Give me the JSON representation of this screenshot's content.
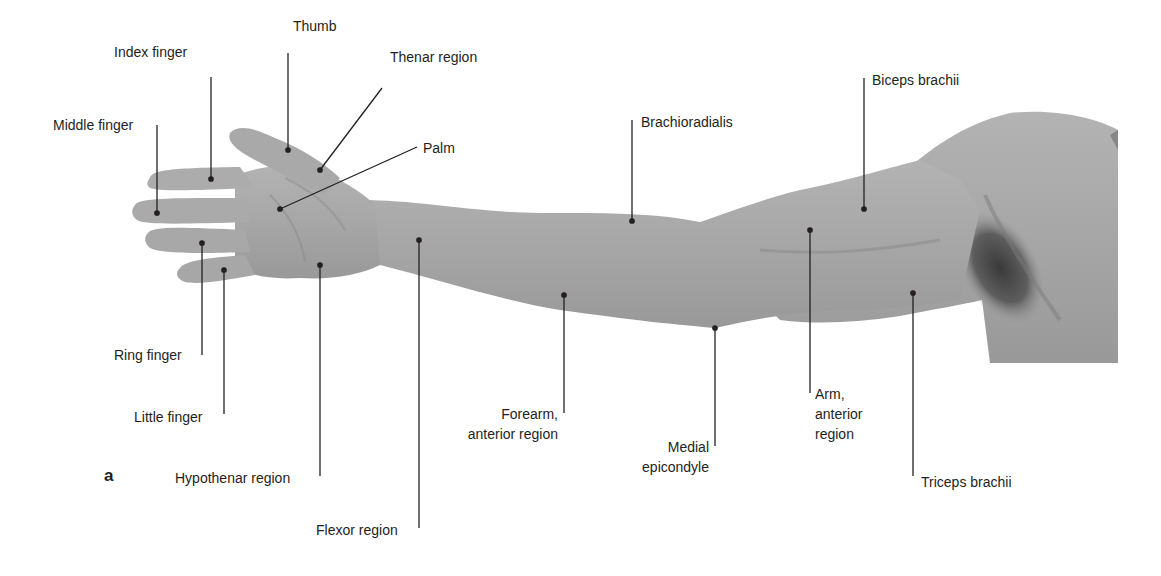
{
  "figure": {
    "panel_letter": "a",
    "colors": {
      "skin": "#a8a8a8",
      "skin_shadow": "#8f8f8f",
      "axilla": "#4a4a4a",
      "leader": "#231f20",
      "text": "#231f20",
      "background": "#ffffff"
    }
  },
  "labels": [
    {
      "id": "thumb",
      "text": "Thumb"
    },
    {
      "id": "index-finger",
      "text": "Index finger"
    },
    {
      "id": "thenar-region",
      "text": "Thenar region"
    },
    {
      "id": "middle-finger",
      "text": "Middle finger"
    },
    {
      "id": "palm",
      "text": "Palm"
    },
    {
      "id": "brachioradialis",
      "text": "Brachioradialis"
    },
    {
      "id": "biceps-brachii",
      "text": "Biceps brachii"
    },
    {
      "id": "ring-finger",
      "text": "Ring finger"
    },
    {
      "id": "little-finger",
      "text": "Little finger"
    },
    {
      "id": "hypothenar-region",
      "text": "Hypothenar region"
    },
    {
      "id": "flexor-region",
      "text": "Flexor region"
    },
    {
      "id": "forearm-anterior-region",
      "lines": [
        "Forearm,",
        "anterior region"
      ]
    },
    {
      "id": "medial-epicondyle",
      "lines": [
        "Medial",
        "epicondyle"
      ]
    },
    {
      "id": "arm-anterior-region",
      "lines": [
        "Arm,",
        "anterior",
        "region"
      ]
    },
    {
      "id": "triceps-brachii",
      "text": "Triceps brachii"
    }
  ]
}
